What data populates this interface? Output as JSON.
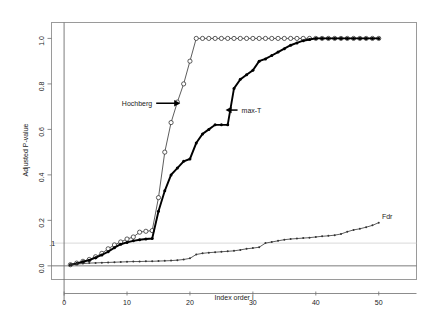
{
  "chart_data": {
    "type": "line",
    "title": "",
    "xlabel": "Index order i",
    "ylabel": "Adjusted P-value",
    "xlim": [
      -2,
      56
    ],
    "ylim": [
      -0.06,
      1.07
    ],
    "xticks": [
      0,
      10,
      20,
      30,
      40,
      50
    ],
    "xticklabels": [
      "0",
      "10",
      "20",
      "30",
      "40",
      "50"
    ],
    "yticks": [
      0.0,
      0.2,
      0.4,
      0.6,
      0.8,
      1.0
    ],
    "yticklabels": [
      "0.0",
      "0.2",
      "0.4",
      "0.6",
      "0.8",
      "1.0"
    ],
    "grid": false,
    "legend_position": "inline-annotations",
    "threshold_line": {
      "label": ".1",
      "value": 0.1
    },
    "zero_line": {
      "value": 0.0
    },
    "vertical_axis_line": {
      "value": 0
    },
    "annotations": [
      {
        "text": "Hochberg",
        "x": 14.0,
        "y": 0.715,
        "arrow": "right"
      },
      {
        "text": "max-T",
        "x": 28.2,
        "y": 0.685,
        "arrow": "left"
      },
      {
        "text": "Fdr",
        "x": 50.5,
        "y": 0.215,
        "arrow": "none"
      }
    ],
    "series": [
      {
        "name": "Hochberg",
        "marker": "open-circle",
        "linewidth": "thin",
        "x": [
          1,
          2,
          3,
          4,
          5,
          6,
          7,
          8,
          9,
          10,
          11,
          12,
          13,
          14,
          15,
          16,
          17,
          18,
          19,
          20,
          21,
          22,
          23,
          24,
          25,
          26,
          27,
          28,
          29,
          30,
          31,
          32,
          33,
          34,
          35,
          36,
          37,
          38,
          39,
          40,
          41,
          42,
          43,
          44,
          45,
          46,
          47,
          48,
          49,
          50
        ],
        "values": [
          0.005,
          0.012,
          0.02,
          0.028,
          0.04,
          0.055,
          0.075,
          0.092,
          0.105,
          0.118,
          0.127,
          0.148,
          0.152,
          0.155,
          0.3,
          0.5,
          0.63,
          0.72,
          0.8,
          0.9,
          1.0,
          1.0,
          1.0,
          1.0,
          1.0,
          1.0,
          1.0,
          1.0,
          1.0,
          1.0,
          1.0,
          1.0,
          1.0,
          1.0,
          1.0,
          1.0,
          1.0,
          1.0,
          1.0,
          1.0,
          1.0,
          1.0,
          1.0,
          1.0,
          1.0,
          1.0,
          1.0,
          1.0,
          1.0,
          1.0
        ]
      },
      {
        "name": "max-T",
        "marker": "filled-dot",
        "linewidth": "thick",
        "x": [
          1,
          2,
          3,
          4,
          5,
          6,
          7,
          8,
          9,
          10,
          11,
          12,
          13,
          14,
          15,
          16,
          17,
          18,
          19,
          20,
          21,
          22,
          23,
          24,
          25,
          26,
          27,
          28,
          29,
          30,
          31,
          32,
          33,
          34,
          35,
          36,
          37,
          38,
          39,
          40,
          41,
          42,
          43,
          44,
          45,
          46,
          47,
          48,
          49,
          50
        ],
        "values": [
          0.005,
          0.01,
          0.018,
          0.025,
          0.036,
          0.048,
          0.062,
          0.08,
          0.095,
          0.103,
          0.11,
          0.115,
          0.118,
          0.12,
          0.24,
          0.33,
          0.4,
          0.43,
          0.46,
          0.47,
          0.54,
          0.58,
          0.6,
          0.62,
          0.62,
          0.62,
          0.78,
          0.82,
          0.84,
          0.86,
          0.9,
          0.91,
          0.925,
          0.94,
          0.955,
          0.97,
          0.98,
          0.99,
          0.995,
          1.0,
          1.0,
          1.0,
          1.0,
          1.0,
          1.0,
          1.0,
          1.0,
          1.0,
          1.0,
          1.0
        ]
      },
      {
        "name": "Fdr",
        "marker": "small-dot",
        "linewidth": "thin",
        "x": [
          1,
          2,
          3,
          4,
          5,
          6,
          7,
          8,
          9,
          10,
          11,
          12,
          13,
          14,
          15,
          16,
          17,
          18,
          19,
          20,
          21,
          22,
          23,
          24,
          25,
          26,
          27,
          28,
          29,
          30,
          31,
          32,
          33,
          34,
          35,
          36,
          37,
          38,
          39,
          40,
          41,
          42,
          43,
          44,
          45,
          46,
          47,
          48,
          49,
          50
        ],
        "values": [
          0.005,
          0.008,
          0.01,
          0.012,
          0.013,
          0.014,
          0.015,
          0.016,
          0.017,
          0.018,
          0.019,
          0.019,
          0.02,
          0.02,
          0.021,
          0.022,
          0.023,
          0.025,
          0.028,
          0.033,
          0.05,
          0.055,
          0.058,
          0.06,
          0.062,
          0.064,
          0.066,
          0.07,
          0.075,
          0.078,
          0.082,
          0.1,
          0.105,
          0.11,
          0.115,
          0.118,
          0.12,
          0.122,
          0.124,
          0.127,
          0.13,
          0.132,
          0.135,
          0.14,
          0.15,
          0.158,
          0.163,
          0.17,
          0.178,
          0.19
        ]
      }
    ]
  }
}
